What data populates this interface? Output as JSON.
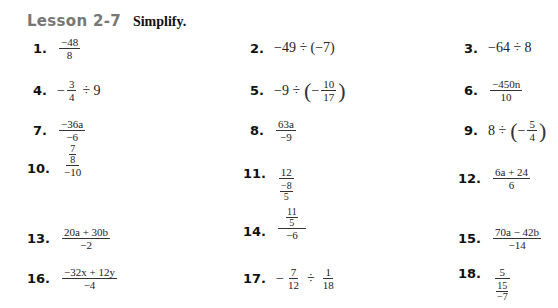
{
  "header": {
    "lesson": "Lesson 2-7",
    "instruction": "Simplify."
  },
  "items": [
    {
      "num": "1.",
      "num_den": {
        "n": "−48",
        "d": "8"
      }
    },
    {
      "num": "2.",
      "text": "−49 ÷ (−7)"
    },
    {
      "num": "3.",
      "text": "−64 ÷ 8"
    },
    {
      "num": "4.",
      "pre": "−",
      "frac": {
        "n": "3",
        "d": "4"
      },
      "post": "÷ 9"
    },
    {
      "num": "5.",
      "pre": "−9 ÷",
      "frac": {
        "n": "10",
        "d": "17"
      },
      "inner_sign": "−"
    },
    {
      "num": "6.",
      "num_den": {
        "n": "−450n",
        "d": "10"
      }
    },
    {
      "num": "7.",
      "num_den": {
        "n": "−36a",
        "d": "−6"
      }
    },
    {
      "num": "8.",
      "num_den": {
        "n": "63a",
        "d": "−9"
      }
    },
    {
      "num": "9.",
      "pre": "8 ÷",
      "frac": {
        "n": "5",
        "d": "4"
      },
      "inner_sign": "−"
    },
    {
      "num": "10.",
      "complex": {
        "n": {
          "n": "7",
          "d": "8"
        },
        "d": "−10"
      }
    },
    {
      "num": "11.",
      "complex": {
        "n": "12",
        "d": {
          "n": "−8",
          "d": "5"
        }
      }
    },
    {
      "num": "12.",
      "num_den": {
        "n": "6a + 24",
        "d": "6"
      }
    },
    {
      "num": "13.",
      "num_den": {
        "n": "20a + 30b",
        "d": "−2"
      }
    },
    {
      "num": "14.",
      "complex": {
        "n": {
          "n": "11",
          "d": "5"
        },
        "d": "−6"
      }
    },
    {
      "num": "15.",
      "num_den": {
        "n": "70a − 42b",
        "d": "−14"
      }
    },
    {
      "num": "16.",
      "num_den": {
        "n": "−32x + 12y",
        "d": "−4"
      }
    },
    {
      "num": "17.",
      "pre": "−",
      "frac": {
        "n": "7",
        "d": "12"
      },
      "op": "÷",
      "frac2": {
        "n": "1",
        "d": "18"
      }
    },
    {
      "num": "18.",
      "complex": {
        "n": "5",
        "d": {
          "n": "15",
          "d": "−7"
        }
      }
    }
  ],
  "symbols": {
    "minus": "−",
    "div": "÷",
    "lparen": "(",
    "rparen": ")"
  }
}
